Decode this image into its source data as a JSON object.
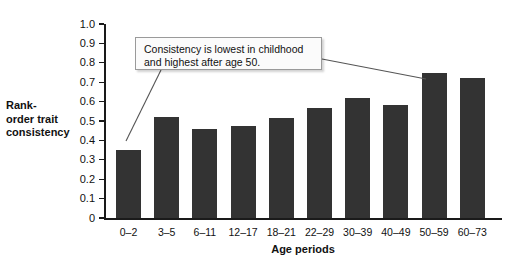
{
  "chart_data": {
    "type": "bar",
    "title": "",
    "xlabel": "Age periods",
    "ylabel": "Rank-order trait consistency",
    "categories": [
      "0–2",
      "3–5",
      "6–11",
      "12–17",
      "18–21",
      "22–29",
      "30–39",
      "40–49",
      "50–59",
      "60–73"
    ],
    "values": [
      0.35,
      0.52,
      0.46,
      0.475,
      0.515,
      0.565,
      0.62,
      0.58,
      0.75,
      0.72
    ],
    "ylim": [
      0,
      1.0
    ],
    "ytick_labels": [
      "1.0",
      "0.9",
      "0.8",
      "0.7",
      "0.6",
      "0.5",
      "0.4",
      "0.3",
      "0.2",
      "0.1",
      "0"
    ],
    "ytick_values": [
      1.0,
      0.9,
      0.8,
      0.7,
      0.6,
      0.5,
      0.4,
      0.3,
      0.2,
      0.1,
      0
    ],
    "grid": false,
    "legend": null,
    "bar_color": "#333333",
    "axis_color": "#1a1a1a",
    "background_color": "#ffffff",
    "annotations": [
      {
        "text": "Consistency is lowest in childhood and highest after age 50.",
        "line1": "Consistency is lowest in childhood",
        "line2": "and highest after age 50.",
        "points_to": [
          "0–2",
          "50–59"
        ]
      }
    ]
  },
  "y_axis": {
    "title_line1": "Rank-",
    "title_line2": "order trait",
    "title_line3": "consistency"
  }
}
